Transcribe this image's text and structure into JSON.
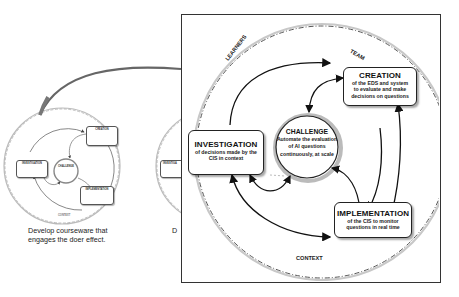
{
  "left_panel": {
    "caption_lines": [
      "Develop courseware that",
      "engages the doer effect."
    ],
    "mini_diagram": {
      "challenge": "CHALLENGE",
      "creation": "CREATION",
      "investigation": "INVESTIGATION",
      "implementation": "IMPLEMENTATION",
      "context": "CONTEXT"
    }
  },
  "middle_panel": {
    "caption_fragment": "D",
    "box_fragment": "INVESTIGA"
  },
  "zoomed_panel": {
    "ring_labels": {
      "learners": "LEARNERS",
      "team": "TEAM",
      "context": "CONTEXT"
    },
    "challenge": {
      "title": "CHALLENGE",
      "lines": [
        "Automate the evaluation",
        "of AI questions",
        "continuously, at scale"
      ]
    },
    "creation": {
      "title": "CREATION",
      "lines": [
        "of the EDS and system",
        "to evaluate and make",
        "decisions on questions"
      ]
    },
    "investigation": {
      "title": "INVESTIGATION",
      "lines": [
        "of decisions made by the",
        "CIS in context"
      ]
    },
    "implementation": {
      "title": "IMPLEMENTATION",
      "lines": [
        "of the CIS to monitor",
        "questions in real time"
      ]
    }
  },
  "colors": {
    "stroke": "#222222",
    "dashed_ring": "#555555",
    "shadow_ring": "#bbbbbb",
    "connector": "#666666",
    "background": "#ffffff"
  }
}
